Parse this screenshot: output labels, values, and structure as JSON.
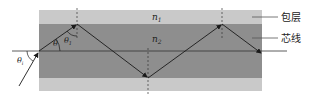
{
  "diagram": {
    "labels": {
      "cladding_index": "n1",
      "core_index": "n2",
      "cladding": "包层",
      "core": "芯线",
      "incident_angle": "θi",
      "refraction_angle": "θ",
      "critical_angle": "θ1"
    },
    "colors": {
      "cladding": "#c9c9c9",
      "core": "#8e8e8e",
      "ray": "#1a1a1a",
      "axis": "#333333",
      "leader": "#555555"
    }
  }
}
